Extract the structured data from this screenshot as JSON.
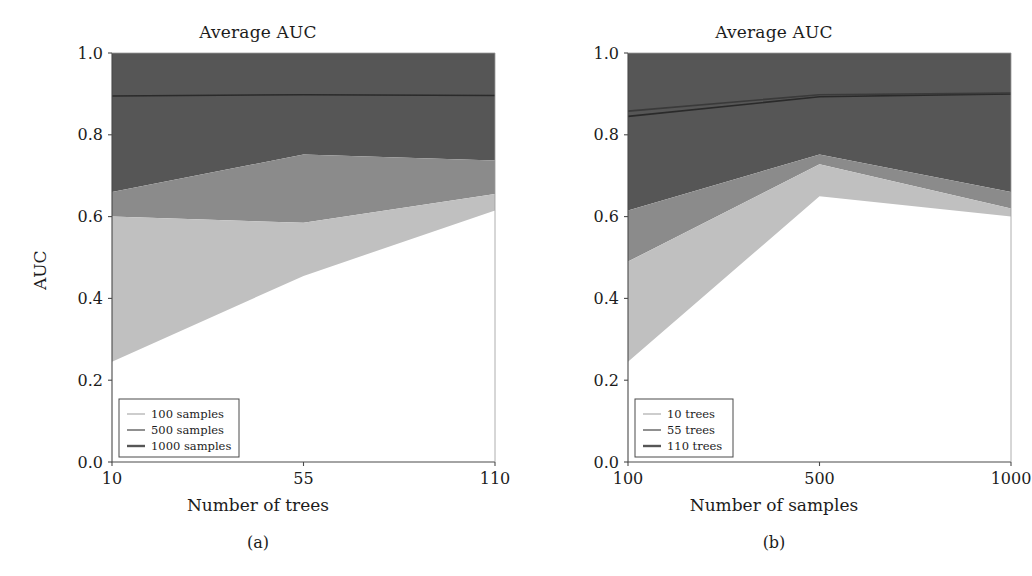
{
  "figure": {
    "background": "#ffffff",
    "panels": [
      "a",
      "b"
    ]
  },
  "panel_a": {
    "title": "Average AUC",
    "caption": "(a)",
    "xlabel": "Number of trees",
    "ylabel": "AUC",
    "xticks": [
      "10",
      "55",
      "110"
    ],
    "yticks": [
      "0.0",
      "0.2",
      "0.4",
      "0.6",
      "0.8",
      "1.0"
    ],
    "legend": [
      {
        "label": "100 samples",
        "color": "#c0c0c0"
      },
      {
        "label": "500 samples",
        "color": "#8b8b8b"
      },
      {
        "label": "1000 samples",
        "color": "#565656"
      }
    ]
  },
  "panel_b": {
    "title": "Average AUC",
    "caption": "(b)",
    "xlabel": "Number of samples",
    "ylabel": "AUC",
    "xticks": [
      "100",
      "500",
      "1000"
    ],
    "yticks": [
      "0.0",
      "0.2",
      "0.4",
      "0.6",
      "0.8",
      "1.0"
    ],
    "legend": [
      {
        "label": "10 trees",
        "color": "#c0c0c0"
      },
      {
        "label": "55 trees",
        "color": "#8b8b8b"
      },
      {
        "label": "110 trees",
        "color": "#565656"
      }
    ]
  },
  "chart_data": [
    {
      "type": "area",
      "panel": "a",
      "title": "Average AUC",
      "xlabel": "Number of trees",
      "ylabel": "AUC",
      "x": [
        10,
        55,
        110
      ],
      "xtick_labels": [
        "10",
        "55",
        "110"
      ],
      "ylim": [
        0.0,
        1.0
      ],
      "ytick_labels": [
        "0.0",
        "0.2",
        "0.4",
        "0.6",
        "0.8",
        "1.0"
      ],
      "grid": false,
      "legend_position": "lower-left",
      "series": [
        {
          "name": "100 samples",
          "color": "#c0c0c0",
          "band_low": [
            0.245,
            0.455,
            0.615
          ],
          "band_high": [
            0.6,
            0.585,
            0.655
          ],
          "mean": [
            0.42,
            0.52,
            0.635
          ]
        },
        {
          "name": "500 samples",
          "color": "#8b8b8b",
          "band_low": [
            0.6,
            0.585,
            0.655
          ],
          "band_high": [
            0.66,
            0.752,
            0.737
          ],
          "mean": [
            0.63,
            0.67,
            0.7
          ]
        },
        {
          "name": "1000 samples",
          "color": "#565656",
          "band_low": [
            0.66,
            0.752,
            0.737
          ],
          "band_high": [
            1.0,
            1.0,
            1.0
          ],
          "mean": [
            0.895,
            0.898,
            0.896
          ]
        }
      ],
      "mean_line_1000": {
        "name": "1000 samples mean",
        "color": "#2a2a2a",
        "values": [
          0.895,
          0.898,
          0.896
        ]
      }
    },
    {
      "type": "area",
      "panel": "b",
      "title": "Average AUC",
      "xlabel": "Number of samples",
      "ylabel": "AUC",
      "x": [
        100,
        500,
        1000
      ],
      "xtick_labels": [
        "100",
        "500",
        "1000"
      ],
      "ylim": [
        0.0,
        1.0
      ],
      "ytick_labels": [
        "0.0",
        "0.2",
        "0.4",
        "0.6",
        "0.8",
        "1.0"
      ],
      "grid": false,
      "legend_position": "lower-left",
      "series": [
        {
          "name": "10 trees",
          "color": "#c0c0c0",
          "band_low": [
            0.245,
            0.65,
            0.6
          ],
          "band_high": [
            0.49,
            0.728,
            0.62
          ],
          "mean": [
            0.37,
            0.69,
            0.61
          ]
        },
        {
          "name": "55 trees",
          "color": "#8b8b8b",
          "band_low": [
            0.49,
            0.728,
            0.62
          ],
          "band_high": [
            0.615,
            0.752,
            0.66
          ],
          "mean": [
            0.55,
            0.74,
            0.64
          ]
        },
        {
          "name": "110 trees",
          "color": "#565656",
          "band_low": [
            0.615,
            0.752,
            0.66
          ],
          "band_high": [
            1.0,
            1.0,
            1.0
          ],
          "mean": [
            0.845,
            0.893,
            0.9
          ]
        }
      ],
      "mean_line_110": {
        "name": "110 trees mean",
        "color": "#2a2a2a",
        "values": [
          0.845,
          0.893,
          0.9
        ]
      },
      "mean_line_upper": {
        "name": "55 trees mean upper",
        "color": "#3a3a3a",
        "values": [
          0.858,
          0.898,
          0.902
        ]
      }
    }
  ]
}
